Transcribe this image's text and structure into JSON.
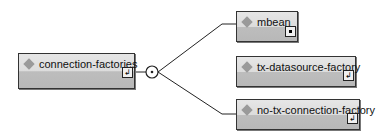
{
  "diagram": {
    "root": {
      "label": "connection-factories",
      "icon": "element-diamond-icon",
      "expander_glyph": "↲"
    },
    "compositor": {
      "type": "choice",
      "icon": "choice-compositor-icon"
    },
    "children": [
      {
        "label": "mbean",
        "icon": "element-diamond-icon",
        "expander": "collapsed-dot"
      },
      {
        "label": "tx-datasource-factory",
        "icon": "element-diamond-icon",
        "expander_glyph": "↲"
      },
      {
        "label": "no-tx-connection-factory",
        "icon": "element-diamond-icon",
        "expander_glyph": "↲"
      }
    ],
    "colors": {
      "box_top": "#e2e2e2",
      "box_bottom": "#bcbcbc",
      "border": "#333333",
      "diamond": "#9a9a9a",
      "line": "#222222"
    }
  }
}
